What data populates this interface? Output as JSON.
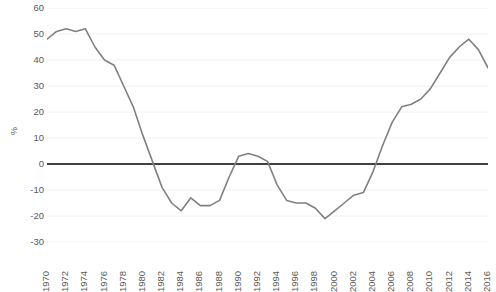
{
  "chart_data": {
    "type": "line",
    "title": "",
    "subtitle": "",
    "xlabel": "",
    "ylabel": "%",
    "ylim": [
      -30,
      60
    ],
    "ytick_values": [
      60,
      50,
      40,
      30,
      20,
      10,
      0,
      -10,
      -20,
      -30
    ],
    "ytick_labels": [
      "60",
      "50",
      "40",
      "30",
      "20",
      "10",
      "0",
      "-10",
      "-20",
      "-30"
    ],
    "xlim": [
      1970,
      2016
    ],
    "xtick_values": [
      1970,
      1972,
      1974,
      1976,
      1978,
      1980,
      1982,
      1984,
      1986,
      1988,
      1990,
      1992,
      1994,
      1996,
      1998,
      2000,
      2002,
      2004,
      2006,
      2008,
      2010,
      2012,
      2014,
      2016
    ],
    "xtick_labels": [
      "1970",
      "1972",
      "1974",
      "1976",
      "1978",
      "1980",
      "1982",
      "1984",
      "1986",
      "1988",
      "1990",
      "1992",
      "1994",
      "1996",
      "1998",
      "2000",
      "2002",
      "2004",
      "2006",
      "2008",
      "2010",
      "2012",
      "2014",
      "2016"
    ],
    "grid": true,
    "grid_color": "#f2f2f2",
    "zero_line": true,
    "zero_line_color": "#404040",
    "legend": false,
    "legend_entries": [],
    "line_color": "#808080",
    "line_width": 1.6,
    "x": [
      1970,
      1971,
      1972,
      1973,
      1974,
      1975,
      1976,
      1977,
      1978,
      1979,
      1980,
      1981,
      1982,
      1983,
      1984,
      1985,
      1986,
      1987,
      1988,
      1989,
      1990,
      1991,
      1992,
      1993,
      1994,
      1995,
      1996,
      1997,
      1998,
      1999,
      2000,
      2001,
      2002,
      2003,
      2004,
      2005,
      2006,
      2007,
      2008,
      2009,
      2010,
      2011,
      2012,
      2013,
      2014,
      2015,
      2016
    ],
    "series": [
      {
        "name": "value",
        "values": [
          48,
          51,
          52,
          51,
          52,
          45,
          40,
          38,
          30,
          22,
          11,
          1,
          -9,
          -15,
          -18,
          -13,
          -16,
          -16,
          -14,
          -5,
          3,
          4,
          3,
          1,
          -8,
          -14,
          -15,
          -15,
          -17,
          -21,
          -18,
          -15,
          -12,
          -11,
          -3,
          7,
          16,
          22,
          23,
          25,
          29,
          35,
          41,
          45,
          48,
          44,
          37
        ]
      }
    ]
  }
}
